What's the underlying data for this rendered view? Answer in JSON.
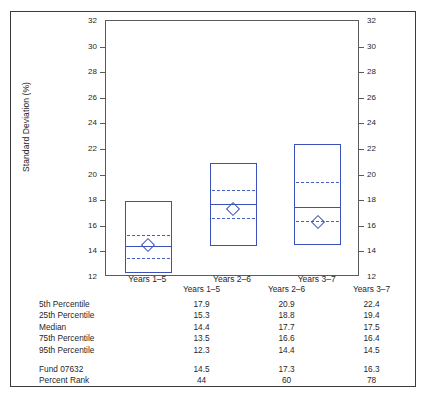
{
  "chart_data": {
    "type": "box",
    "title": "",
    "xlabel": "",
    "ylabel": "Standard Deviation (%)",
    "ylim": [
      12,
      32
    ],
    "yticks": [
      12,
      14,
      16,
      18,
      20,
      22,
      24,
      26,
      28,
      30,
      32
    ],
    "grid": false,
    "dual_axis": true,
    "legend": "none",
    "categories": [
      "Years 1–5",
      "Years 2–6",
      "Years 3–7"
    ],
    "series": [
      {
        "name": "5th Percentile",
        "values": [
          17.9,
          20.9,
          22.4
        ]
      },
      {
        "name": "25th Percentile",
        "values": [
          15.3,
          18.8,
          19.4
        ]
      },
      {
        "name": "Median",
        "values": [
          14.4,
          17.7,
          17.5
        ]
      },
      {
        "name": "75th Percentile",
        "values": [
          13.5,
          16.6,
          16.4
        ]
      },
      {
        "name": "95th Percentile",
        "values": [
          12.3,
          14.4,
          14.5
        ]
      },
      {
        "name": "Fund 07632",
        "values": [
          14.5,
          17.3,
          16.3
        ]
      },
      {
        "name": "Percent Rank",
        "values": [
          44,
          60,
          78
        ]
      }
    ],
    "box_top_field": "5th Percentile",
    "box_bottom_field": "95th Percentile",
    "median_field": "Median",
    "dashed_fields": [
      "25th Percentile",
      "75th Percentile"
    ],
    "marker_field": "Fund 07632",
    "marker_shape": "diamond"
  },
  "colors": {
    "series_blue": "#3a52b8",
    "dash_blue": "#4560c4",
    "axis_gray": "#5b5b5b",
    "frame_gray": "#3c3c3c",
    "text": "#1f1f1f"
  },
  "axis": {
    "y_label": "Standard Deviation (%)",
    "ticks": [
      "32",
      "30",
      "28",
      "26",
      "24",
      "22",
      "20",
      "18",
      "16",
      "14",
      "12"
    ]
  },
  "categories": [
    {
      "label": "Years 1–5"
    },
    {
      "label": "Years 2–6"
    },
    {
      "label": "Years 3–7"
    }
  ],
  "table": {
    "corner_header": "",
    "columns": [
      "Years 1–5",
      "Years 2–6",
      "Years 3–7"
    ],
    "rows": [
      {
        "label": "5th Percentile",
        "values": [
          "17.9",
          "20.9",
          "22.4"
        ]
      },
      {
        "label": "25th Percentile",
        "values": [
          "15.3",
          "18.8",
          "19.4"
        ]
      },
      {
        "label": "Median",
        "values": [
          "14.4",
          "17.7",
          "17.5"
        ]
      },
      {
        "label": "75th Percentile",
        "values": [
          "13.5",
          "16.6",
          "16.4"
        ]
      },
      {
        "label": "95th Percentile",
        "values": [
          "12.3",
          "14.4",
          "14.5"
        ]
      }
    ],
    "rows2": [
      {
        "label": "Fund 07632",
        "values": [
          "14.5",
          "17.3",
          "16.3"
        ]
      },
      {
        "label": "Percent Rank",
        "values": [
          "44",
          "60",
          "78"
        ]
      }
    ]
  }
}
